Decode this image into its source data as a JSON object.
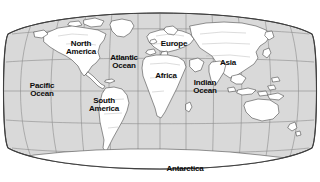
{
  "map": {
    "kind": "world-map",
    "projection": "robinson-oval",
    "title": "World Map with Continents and Oceans",
    "colors": {
      "ocean": "#d9d9d9",
      "land": "#ffffff",
      "coastline": "#5a5a5a",
      "graticule": "#8c8c8c",
      "border": "#4a4a4a",
      "label": "#0b0b0b",
      "background": "#ffffff"
    },
    "graticule": {
      "visible": true,
      "meridian_spacing_deg": 30,
      "parallel_spacing_deg": 30
    },
    "labels": [
      {
        "id": "north-america",
        "type": "continent",
        "lines": [
          "North",
          "America"
        ],
        "x": 81,
        "y": 48
      },
      {
        "id": "south-america",
        "type": "continent",
        "lines": [
          "South",
          "America"
        ],
        "x": 104,
        "y": 105
      },
      {
        "id": "europe",
        "type": "continent",
        "lines": [
          "Europe"
        ],
        "x": 174,
        "y": 44
      },
      {
        "id": "africa",
        "type": "continent",
        "lines": [
          "Africa"
        ],
        "x": 166,
        "y": 76
      },
      {
        "id": "asia",
        "type": "continent",
        "lines": [
          "Asia"
        ],
        "x": 228,
        "y": 63
      },
      {
        "id": "antarctica",
        "type": "continent",
        "lines": [
          "Antarctica"
        ],
        "x": 185,
        "y": 169
      },
      {
        "id": "pacific-ocean",
        "type": "ocean",
        "lines": [
          "Pacific",
          "Ocean"
        ],
        "x": 42,
        "y": 90
      },
      {
        "id": "atlantic-ocean",
        "type": "ocean",
        "lines": [
          "Atlantic",
          "Ocean"
        ],
        "x": 124,
        "y": 62
      },
      {
        "id": "indian-ocean",
        "type": "ocean",
        "lines": [
          "Indian",
          "Ocean"
        ],
        "x": 205,
        "y": 87
      }
    ]
  }
}
